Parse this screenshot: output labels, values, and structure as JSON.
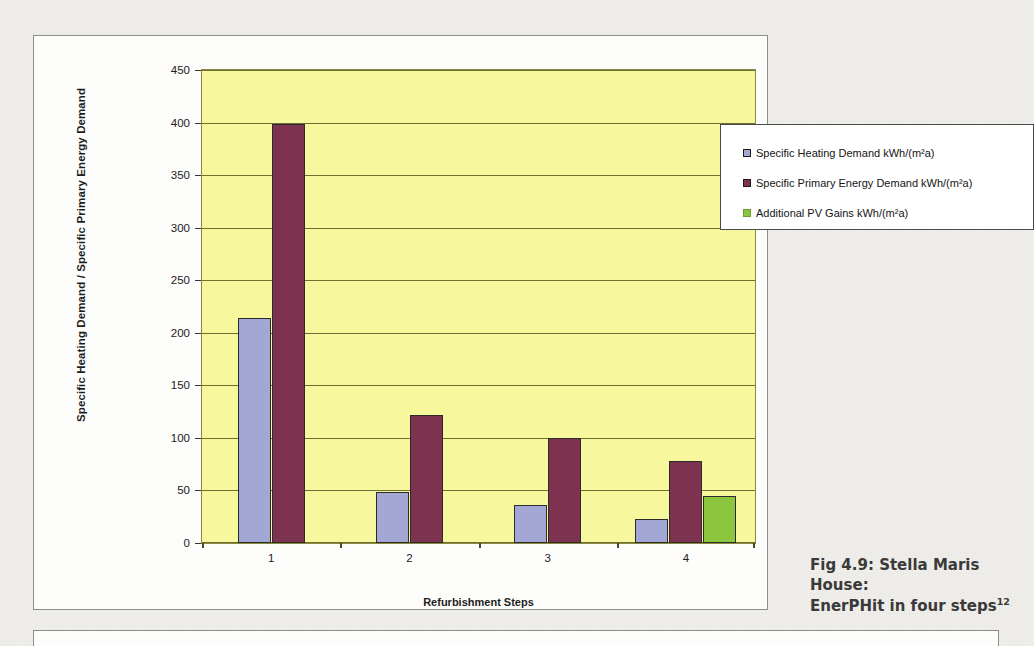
{
  "chart_data": {
    "type": "bar",
    "title": "",
    "xlabel": "Refurbishment Steps",
    "ylabel": "Specific Heating Demand / Specific Primary Energy Demand",
    "categories": [
      "1",
      "2",
      "3",
      "4"
    ],
    "series": [
      {
        "name": "Specific Heating Demand kWh/(m²a)",
        "color": "#a2a8d3",
        "values": [
          214,
          49,
          36,
          23
        ]
      },
      {
        "name": "Specific Primary Energy Demand kWh/(m²a)",
        "color": "#7d3350",
        "values": [
          399,
          122,
          100,
          78
        ]
      },
      {
        "name": "Additional PV Gains kWh/(m²a)",
        "color": "#8cc63f",
        "values": [
          null,
          null,
          null,
          45
        ]
      }
    ],
    "ylim": [
      0,
      450
    ],
    "yticks": [
      0,
      50,
      100,
      150,
      200,
      250,
      300,
      350,
      400,
      450
    ],
    "ytick_labels": [
      "0",
      "50",
      "100",
      "150",
      "200",
      "250",
      "300",
      "350",
      "400",
      "450"
    ],
    "grid": true,
    "legend_position": "top-right",
    "plot_background": "#f7f79e"
  },
  "legend": {
    "items": [
      {
        "label": "Specific Heating Demand kWh/(m²a)"
      },
      {
        "label": "Specific Primary Energy Demand kWh/(m²a)"
      },
      {
        "label": "Additional PV Gains kWh/(m²a)"
      }
    ]
  },
  "caption": {
    "line1": "Fig 4.9: Stella Maris House:",
    "line2": "EnerPHit in four steps",
    "footnote": "12"
  }
}
